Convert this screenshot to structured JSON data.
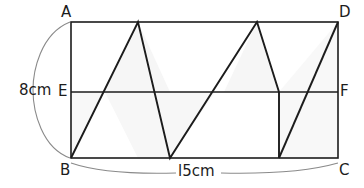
{
  "figure": {
    "type": "geometry-diagram",
    "shape": "rectangle",
    "stroke_color": "#1c1c1c",
    "fill_color": "#f7f7f7",
    "background_color": "#ffffff",
    "brace_color": "#6e6e6e"
  },
  "vertex_labels": {
    "a": "A",
    "b": "B",
    "c": "C",
    "d": "D",
    "e": "E",
    "f": "F"
  },
  "dimensions": {
    "height_label": "8cm",
    "height_value": 8,
    "height_unit": "cm",
    "width_label": "l5cm",
    "width_value": 15,
    "width_unit": "cm"
  },
  "geometry": {
    "rect": {
      "left": 71,
      "top": 22,
      "right": 338,
      "bottom": 158
    },
    "midline_y": 92,
    "zigzag_points": [
      [
        71,
        158
      ],
      [
        138,
        22
      ],
      [
        170,
        158
      ],
      [
        257,
        22
      ],
      [
        279,
        92
      ]
    ],
    "vertical_segment": [
      [
        279,
        92
      ],
      [
        279,
        158
      ]
    ],
    "closing_segment": [
      [
        279,
        158
      ],
      [
        338,
        22
      ]
    ],
    "shaded_regions": [
      "triangle-apex1-right",
      "triangle-midline-left",
      "triangle-apex2-right",
      "triangle-right-end"
    ]
  }
}
